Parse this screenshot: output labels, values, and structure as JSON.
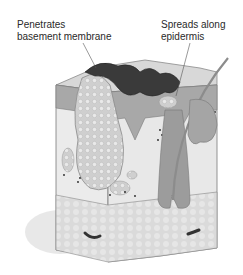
{
  "figure": {
    "labels": [
      {
        "id": "penetrates",
        "lines": [
          "Penetrates",
          "basement membrane"
        ]
      },
      {
        "id": "spreads",
        "lines": [
          "Spreads along",
          "epidermis"
        ]
      }
    ]
  },
  "colors": {
    "tumor_dark": "#3a3a3a",
    "epidermis": "#9a9a9a",
    "dermis": "#e6e6e6",
    "subcutis": "#d9d9d9",
    "tumor_nodule": "#c9c9c9",
    "outline": "#6e6e6e"
  }
}
